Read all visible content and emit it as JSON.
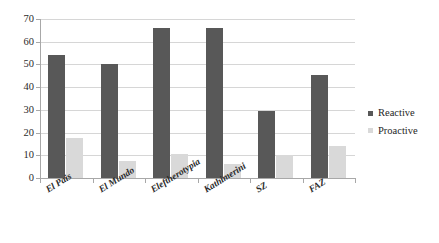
{
  "chart_data": {
    "type": "bar",
    "title": "",
    "subtitle": "",
    "xlabel": "",
    "ylabel": "",
    "categories": [
      "El Pais",
      "El Mundo",
      "Eleftherotypia",
      "Kathimerini",
      "SZ",
      "FAZ"
    ],
    "series": [
      {
        "name": "Reactive",
        "color": "#585858",
        "values": [
          54,
          50,
          66,
          66,
          29.5,
          45.5
        ]
      },
      {
        "name": "Proactive",
        "color": "#d9d9d9",
        "values": [
          17.5,
          7.5,
          10.5,
          6,
          10,
          14
        ]
      }
    ],
    "ylim": [
      0,
      70
    ],
    "ytick_labels": [
      "70",
      "60",
      "50",
      "40",
      "30",
      "20",
      "10",
      "0"
    ],
    "ytick_values": [
      70,
      60,
      50,
      40,
      30,
      20,
      10,
      0
    ],
    "ytick_step": 10,
    "grid": "horizontal",
    "legend_position": "right",
    "legend_entries": [
      "Reactive",
      "Proactive"
    ],
    "plot_background": "#ffffff",
    "gridline_color": "#d6d6d6",
    "axis_color": "#a8a8a8"
  }
}
